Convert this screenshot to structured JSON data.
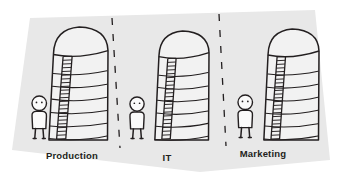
{
  "illustration": {
    "title": "Organizational Silos",
    "style": "hand-drawn sketch on tilted paper sheet",
    "paper": {
      "fill_color": "#e8e8e8",
      "outside_color": "#ffffff",
      "corners": "30,18 315,10 330,160 200,172 12,150"
    },
    "ink_color": "#231f20",
    "silo_fill_color": "#f2f2f2",
    "person_fill_color": "#fafafa"
  },
  "sections": [
    {
      "id": "production",
      "label": "Production",
      "label_x": 72,
      "label_y": 159,
      "silo": {
        "x": 47,
        "y": 27,
        "width": 62,
        "height": 113,
        "bands": 6,
        "ladder_side": "left",
        "ladder_rungs": 22
      },
      "person": {
        "x": 30,
        "y": 95,
        "height": 44
      }
    },
    {
      "id": "it",
      "label": "IT",
      "label_x": 167,
      "label_y": 161,
      "silo": {
        "x": 153,
        "y": 31,
        "width": 57,
        "height": 109,
        "bands": 6,
        "ladder_side": "left",
        "ladder_rungs": 21
      },
      "person": {
        "x": 128,
        "y": 96,
        "height": 43
      }
    },
    {
      "id": "marketing",
      "label": "Marketing",
      "label_x": 263,
      "label_y": 157,
      "silo": {
        "x": 262,
        "y": 29,
        "width": 58,
        "height": 111,
        "bands": 6,
        "ladder_side": "left",
        "ladder_rungs": 22
      },
      "person": {
        "x": 236,
        "y": 94,
        "height": 44
      }
    }
  ],
  "dividers": [
    {
      "id": "divider-1",
      "x1": 112,
      "y1": 18,
      "x2": 120,
      "y2": 148,
      "style": "dashed"
    },
    {
      "id": "divider-2",
      "x1": 219,
      "y1": 14,
      "x2": 226,
      "y2": 146,
      "style": "dashed"
    }
  ]
}
